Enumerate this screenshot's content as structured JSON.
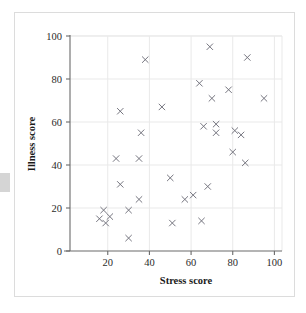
{
  "figure": {
    "frame_border_color": "#dcdcdc",
    "background_color": "#ffffff",
    "marker_color": "#6e6e78",
    "axis_color": "#6a6a6a",
    "grid_color": "#e9e9e9"
  },
  "chart_data": {
    "type": "scatter",
    "title": "",
    "xlabel": "Stress score",
    "ylabel": "Illness score",
    "xlim": [
      0,
      104
    ],
    "ylim": [
      0,
      100
    ],
    "xticks": [
      20,
      40,
      60,
      80,
      100
    ],
    "yticks": [
      0,
      20,
      40,
      60,
      80,
      100
    ],
    "xtick_labels": [
      "20",
      "40",
      "60",
      "80",
      "100"
    ],
    "ytick_labels": [
      "0",
      "20",
      "40",
      "60",
      "80",
      "100"
    ],
    "grid": "both-light",
    "legend": "none",
    "marker": "x",
    "n_points": 37,
    "series": [
      {
        "name": "Stress vs Illness",
        "points": [
          [
            16,
            15
          ],
          [
            18,
            19
          ],
          [
            19,
            13
          ],
          [
            21,
            16
          ],
          [
            24,
            43
          ],
          [
            26,
            65
          ],
          [
            26,
            31
          ],
          [
            30,
            19
          ],
          [
            30,
            6
          ],
          [
            35,
            24
          ],
          [
            35,
            43
          ],
          [
            36,
            55
          ],
          [
            38,
            89
          ],
          [
            46,
            67
          ],
          [
            50,
            34
          ],
          [
            51,
            13
          ],
          [
            57,
            24
          ],
          [
            61,
            26
          ],
          [
            64,
            78
          ],
          [
            65,
            14
          ],
          [
            66,
            58
          ],
          [
            68,
            30
          ],
          [
            69,
            95
          ],
          [
            70,
            71
          ],
          [
            72,
            59
          ],
          [
            72,
            55
          ],
          [
            78,
            75
          ],
          [
            80,
            46
          ],
          [
            81,
            56
          ],
          [
            84,
            54
          ],
          [
            86,
            41
          ],
          [
            87,
            90
          ],
          [
            95,
            71
          ]
        ]
      }
    ]
  }
}
